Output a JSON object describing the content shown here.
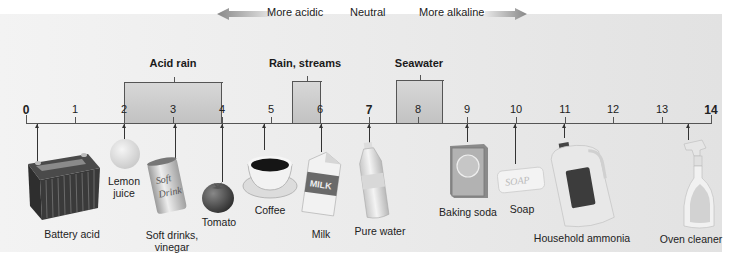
{
  "direction": {
    "acidic_label": "More acidic",
    "neutral_label": "Neutral",
    "alkaline_label": "More alkaline"
  },
  "ranges": [
    {
      "label": "Acid rain",
      "from": 2,
      "to": 4
    },
    {
      "label": "Rain, streams",
      "from": 5.4,
      "to": 6
    },
    {
      "label": "Seawater",
      "from": 7.5,
      "to": 8.5
    }
  ],
  "axis": {
    "ticks": [
      "0",
      "1",
      "2",
      "3",
      "4",
      "5",
      "6",
      "7",
      "8",
      "9",
      "10",
      "11",
      "12",
      "13",
      "14"
    ],
    "bold_ticks": [
      "0",
      "7",
      "14"
    ]
  },
  "items": [
    {
      "label": "Battery acid",
      "ph": 0.2
    },
    {
      "label": "Lemon juice",
      "line1": "Lemon",
      "line2": "juice",
      "ph": 2
    },
    {
      "label": "Soft drinks, vinegar",
      "line1": "Soft drinks,",
      "line2": "vinegar",
      "ph": 3
    },
    {
      "label": "Tomato",
      "ph": 4
    },
    {
      "label": "Coffee",
      "ph": 4.9
    },
    {
      "label": "Milk",
      "ph": 6
    },
    {
      "label": "Pure water",
      "ph": 7
    },
    {
      "label": "Baking soda",
      "ph": 9
    },
    {
      "label": "Soap",
      "ph": 10
    },
    {
      "label": "Household ammonia",
      "ph": 11
    },
    {
      "label": "Oven cleaner",
      "ph": 13.5
    }
  ],
  "product_text": {
    "soft_drink_can": "Soft Drink",
    "milk_carton": "MILK",
    "soap_bar": "SOAP"
  },
  "colors": {
    "background": "#ebebeb",
    "range_fill": "#c8c8c8",
    "axis": "#555555",
    "arrow": "#888888"
  }
}
